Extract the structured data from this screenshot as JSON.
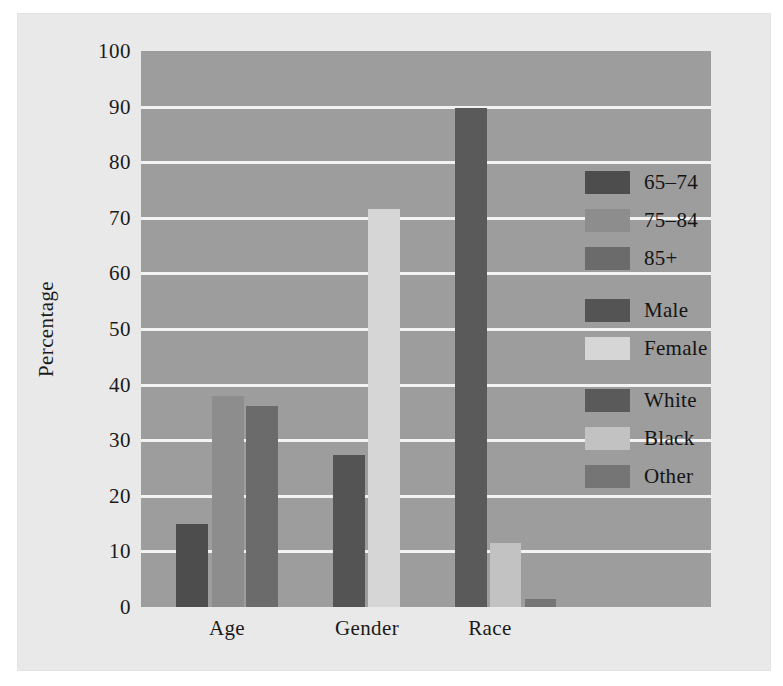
{
  "chart_data": {
    "type": "bar",
    "title": "",
    "xlabel": "",
    "ylabel": "Percentage",
    "ylim": [
      0,
      100
    ],
    "ytick_values": [
      0,
      10,
      20,
      30,
      40,
      50,
      60,
      70,
      80,
      90,
      100
    ],
    "ytick_labels": [
      "0",
      "10",
      "20",
      "30",
      "40",
      "50",
      "60",
      "70",
      "80",
      "90",
      "100"
    ],
    "categories": [
      "Age",
      "Gender",
      "Race"
    ],
    "grid": "horizontal",
    "legend_position": "inside-right",
    "plot_background": "#9d9d9d",
    "figure_background": "#e9e9e9",
    "gridline_color": "#f2f2f2",
    "bars": [
      {
        "group": "Age",
        "series": "65-74",
        "label": "65–74",
        "value": 15.0,
        "color": "#4d4d4d"
      },
      {
        "group": "Age",
        "series": "75-84",
        "label": "75–84",
        "value": 38.0,
        "color": "#8d8d8d"
      },
      {
        "group": "Age",
        "series": "85+",
        "label": "85+",
        "value": 36.1,
        "color": "#6b6b6b"
      },
      {
        "group": "Gender",
        "series": "Male",
        "label": "Male",
        "value": 27.4,
        "color": "#545454"
      },
      {
        "group": "Gender",
        "series": "Female",
        "label": "Female",
        "value": 71.6,
        "color": "#d6d6d6"
      },
      {
        "group": "Race",
        "series": "White",
        "label": "White",
        "value": 89.7,
        "color": "#5a5a5a"
      },
      {
        "group": "Race",
        "series": "Black",
        "label": "Black",
        "value": 11.6,
        "color": "#c2c2c2"
      },
      {
        "group": "Race",
        "series": "Other",
        "label": "Other",
        "value": 1.5,
        "color": "#757575"
      }
    ],
    "legend_entries": [
      {
        "label": "65–74",
        "color": "#4d4d4d",
        "group": "Age"
      },
      {
        "label": "75–84",
        "color": "#8d8d8d",
        "group": "Age"
      },
      {
        "label": "85+",
        "color": "#6b6b6b",
        "group": "Age"
      },
      {
        "label": "Male",
        "color": "#545454",
        "group": "Gender"
      },
      {
        "label": "Female",
        "color": "#d6d6d6",
        "group": "Gender"
      },
      {
        "label": "White",
        "color": "#5a5a5a",
        "group": "Race"
      },
      {
        "label": "Black",
        "color": "#c2c2c2",
        "group": "Race"
      },
      {
        "label": "Other",
        "color": "#757575",
        "group": "Race"
      }
    ]
  }
}
